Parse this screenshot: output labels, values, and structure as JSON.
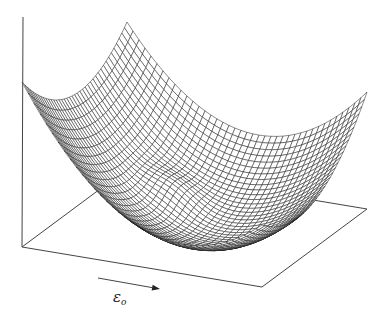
{
  "figure": {
    "kind": "3d-wireframe-surface",
    "axis_label": "ε",
    "axis_label_subscript": "o",
    "axis_arrow": true,
    "grid_lines": 40,
    "colors": {
      "background": "#ffffff",
      "mesh": "#1a1a1a",
      "axes": "#444444"
    },
    "projection": {
      "origin": [
        22,
        247
      ],
      "front_right": [
        262,
        287
      ],
      "left_back": [
        127,
        169
      ],
      "vertical_axis_top": [
        23,
        17
      ]
    },
    "surface": {
      "minimum_uv": [
        0.62,
        0.42
      ],
      "quad_a": 301.4,
      "quad_b": 170.6,
      "quad_c": 73.0,
      "bump": {
        "u": 0.38,
        "v": 0.58,
        "amp": 14,
        "sigma": 0.09
      }
    },
    "arrow": {
      "from": [
        98,
        278
      ],
      "to": [
        160,
        289
      ]
    },
    "label_pos": [
      113,
      302
    ]
  }
}
